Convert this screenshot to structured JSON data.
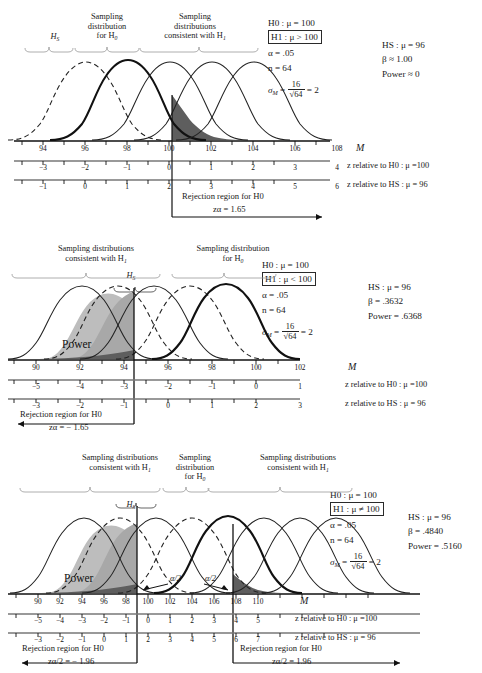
{
  "figure": {
    "symbols": {
      "M": "M",
      "mu": "μ",
      "alpha": "α",
      "beta": "β",
      "sigma": "σ",
      "neq": "≠",
      "approx": "≈",
      "gt": ">",
      "lt": "<",
      "minus": "−"
    },
    "colors": {
      "curve_stroke": "#1a1a1a",
      "power_light": "#bdbdbd",
      "power_dark": "#7a7a7a",
      "tail_dark": "#5a5a5a",
      "axis": "#111111",
      "background": "#ffffff"
    }
  },
  "panels": [
    {
      "id": "panel-1",
      "brackets": [
        {
          "label_lines": [
            "H_S"
          ],
          "name": "bracket-hs"
        },
        {
          "label_lines": [
            "Sampling",
            "distribution",
            "for H0"
          ],
          "name": "bracket-h0"
        },
        {
          "label_lines": [
            "Sampling",
            "distributions",
            "consistent with H1"
          ],
          "name": "bracket-h1"
        }
      ],
      "label_hs": "H",
      "label_hs_sub": "S",
      "top_labels": {
        "h0_l1": "Sampling",
        "h0_l2": "distribution",
        "h0_l3": "for H",
        "h0_l3_sub": "0",
        "h1_l1": "Sampling",
        "h1_l2": "distributions",
        "h1_l3": "consistent with H",
        "h1_l3_sub": "1"
      },
      "stats": {
        "h0": "H0 : μ = 100",
        "h1": "H1 : μ > 100",
        "alpha": "α = .05",
        "n": "n = 64",
        "sigma_m_lead": "σM",
        "sigma_m_eq": "=",
        "sigma_num": "16",
        "sigma_den": "√64",
        "sigma_res": "= 2",
        "hs": "HS : μ = 96",
        "beta": "β ≈ 1.00",
        "power": "Power ≈ 0"
      },
      "axes": {
        "m_ticks": [
          "94",
          "96",
          "98",
          "100",
          "102",
          "104",
          "106",
          "108"
        ],
        "m_label": "M",
        "z0_ticks": [
          "−3",
          "−2",
          "−1",
          "0",
          "1",
          "2",
          "3",
          "4"
        ],
        "z0_label": "z relative to H0 : μ =100",
        "zs_ticks": [
          "−1",
          "0",
          "1",
          "2",
          "3",
          "4",
          "5",
          "6"
        ],
        "zs_label": "z relative to HS : μ = 96"
      },
      "rejection": {
        "text": "Rejection region for H0",
        "z_label": "zα = 1.65",
        "direction": "right"
      },
      "curves": [
        {
          "name": "hs-dashed",
          "mean": 96,
          "style": "dashed",
          "weight": "thin"
        },
        {
          "name": "h0-bold",
          "mean": 100,
          "style": "solid",
          "weight": "bold"
        },
        {
          "name": "h1-a",
          "mean": 102,
          "style": "solid",
          "weight": "thin"
        },
        {
          "name": "h1-b",
          "mean": 104,
          "style": "solid",
          "weight": "thin"
        },
        {
          "name": "h1-c",
          "mean": 106,
          "style": "solid",
          "weight": "thin"
        }
      ]
    },
    {
      "id": "panel-2",
      "top_labels": {
        "h1_l1": "Sampling distributions",
        "h1_l2": "consistent with H",
        "h1_l2_sub": "1",
        "h0_l1": "Sampling distribution",
        "h0_l2": "for H",
        "h0_l2_sub": "0"
      },
      "label_hs": "H",
      "label_hs_sub": "S",
      "stats": {
        "h0": "H0 : μ = 100",
        "h1": "H1 : μ < 100",
        "alpha": "α = .05",
        "n": "n = 64",
        "sigma_num": "16",
        "sigma_den": "√64",
        "sigma_res": "= 2",
        "hs": "HS : μ = 96",
        "beta": "β = .3632",
        "power": "Power = .6368"
      },
      "power_label": "Power",
      "axes": {
        "m_ticks": [
          "90",
          "92",
          "94",
          "96",
          "98",
          "100",
          "102"
        ],
        "m_label": "M",
        "z0_ticks": [
          "−5",
          "−4",
          "−3",
          "−2",
          "−1",
          "0",
          "1"
        ],
        "z0_label": "z relative to H0 : μ =100",
        "zs_ticks": [
          "−3",
          "−2",
          "−1",
          "0",
          "1",
          "2",
          "3"
        ],
        "zs_label": "z relative to HS : μ = 96"
      },
      "rejection": {
        "text": "Rejection region for H0",
        "z_label": "zα = − 1.65",
        "direction": "left"
      },
      "curves": [
        {
          "name": "h1-a",
          "mean": 91.5,
          "style": "solid",
          "weight": "thin"
        },
        {
          "name": "hs-dashed",
          "mean": 94,
          "style": "dashed",
          "weight": "thin"
        },
        {
          "name": "h1-c",
          "mean": 96,
          "style": "solid",
          "weight": "thin"
        },
        {
          "name": "h1-d",
          "mean": 98,
          "style": "dashed",
          "weight": "thin"
        },
        {
          "name": "h0-bold",
          "mean": 100,
          "style": "solid",
          "weight": "bold"
        }
      ]
    },
    {
      "id": "panel-3",
      "top_labels": {
        "left_l1": "Sampling distributions",
        "left_l2": "consistent with H",
        "left_l2_sub": "1",
        "mid_l1": "Sampling",
        "mid_l2": "distribution",
        "mid_l3": "for H",
        "mid_l3_sub": "0",
        "right_l1": "Sampling distributions",
        "right_l2": "consistent with H",
        "right_l2_sub": "1"
      },
      "label_hs": "H",
      "label_hs_sub": "S",
      "stats": {
        "h0": "H0 : μ = 100",
        "h1": "H1 : μ ≠ 100",
        "alpha": "α = .05",
        "n": "n = 64",
        "sigma_num": "16",
        "sigma_den": "√64",
        "sigma_res": "= 2",
        "hs": "HS : μ = 96",
        "beta": "β = .4840",
        "power": "Power = .5160"
      },
      "power_label": "Power",
      "alpha_left": "α/2",
      "alpha_right": "α/2",
      "axes": {
        "m_ticks": [
          "90",
          "92",
          "94",
          "96",
          "98",
          "100",
          "102",
          "104",
          "106",
          "108",
          "110"
        ],
        "m_label": "M",
        "z0_ticks": [
          "−5",
          "−4",
          "−3",
          "−2",
          "−1",
          "0",
          "1",
          "2",
          "3",
          "4",
          "5"
        ],
        "z0_label": "z relative to H0 : μ =100",
        "zs_ticks": [
          "−3",
          "−2",
          "−1",
          "0",
          "1",
          "2",
          "3",
          "4",
          "5",
          "6",
          "7"
        ],
        "zs_label": "z relative to HS : μ = 96"
      },
      "rejection_left": {
        "text": "Rejection region for H0",
        "z_label": "zα/2 = − 1.96",
        "direction": "left"
      },
      "rejection_right": {
        "text": "Rejection region for H0",
        "z_label": "zα/2 = 1.96",
        "direction": "right"
      },
      "curves": [
        {
          "name": "c1",
          "mean": 91.5,
          "style": "solid",
          "weight": "thin"
        },
        {
          "name": "hs-dashed",
          "mean": 94,
          "style": "dashed",
          "weight": "thin"
        },
        {
          "name": "c3",
          "mean": 96,
          "style": "solid",
          "weight": "thin"
        },
        {
          "name": "c4",
          "mean": 98,
          "style": "dashed",
          "weight": "thin"
        },
        {
          "name": "h0-bold",
          "mean": 100,
          "style": "solid",
          "weight": "bold"
        },
        {
          "name": "c6",
          "mean": 102,
          "style": "solid",
          "weight": "thin"
        },
        {
          "name": "c7",
          "mean": 104.5,
          "style": "solid",
          "weight": "thin"
        },
        {
          "name": "c8",
          "mean": 107,
          "style": "solid",
          "weight": "thin"
        }
      ]
    }
  ]
}
